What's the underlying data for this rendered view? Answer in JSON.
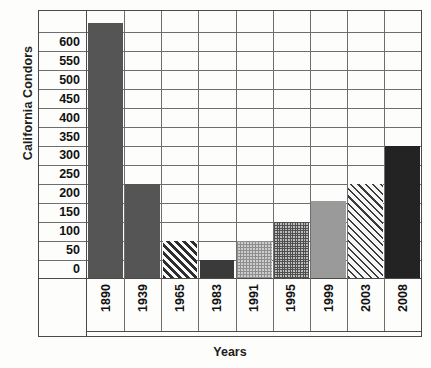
{
  "chart_data": {
    "type": "bar",
    "title": "",
    "xlabel": "Years",
    "ylabel": "California Condors",
    "categories": [
      "1890",
      "1939",
      "1965",
      "1983",
      "1991",
      "1995",
      "1999",
      "2003",
      "2008"
    ],
    "values": [
      650,
      225,
      75,
      25,
      75,
      125,
      180,
      225,
      325
    ],
    "ylim": [
      0,
      650
    ],
    "ytick_labels": [
      "600",
      "550",
      "500",
      "450",
      "400",
      "350",
      "300",
      "250",
      "200",
      "150",
      "100",
      "50",
      "0"
    ],
    "ytick_values": [
      600,
      550,
      500,
      450,
      400,
      350,
      300,
      250,
      200,
      150,
      100,
      50,
      0
    ],
    "grid": true,
    "legend": false,
    "bar_styles": [
      "solid-dark-gray",
      "solid-dark-gray",
      "diagonal-hatch",
      "solid-dark",
      "light-gray-dots",
      "gray-checker",
      "solid-medium-gray",
      "light-diagonal-hatch",
      "solid-black"
    ],
    "colors": {
      "dark_gray": "#555555",
      "dark": "#3a3a3a",
      "medium_gray": "#9a9a9a",
      "black": "#232323",
      "grid": "#6e6e6e",
      "axis": "#4a4a4a",
      "background": "#fdfdfb"
    }
  }
}
